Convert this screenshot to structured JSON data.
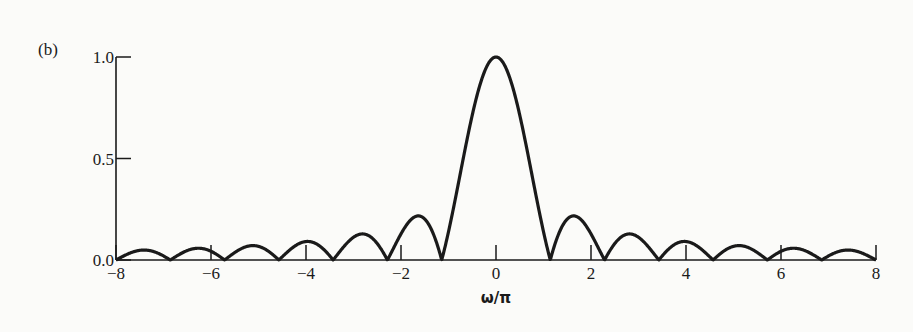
{
  "panel_label": "(b)",
  "chart_data": {
    "type": "line",
    "title": "",
    "panel": "(b)",
    "xlabel": "ω/π",
    "ylabel": "",
    "xlim": [
      -8,
      8
    ],
    "ylim": [
      0,
      1.0
    ],
    "x_ticks": [
      -8,
      -6,
      -4,
      -2,
      0,
      2,
      4,
      6,
      8
    ],
    "x_tick_labels": [
      "−8",
      "−6",
      "−4",
      "−2",
      "0",
      "2",
      "4",
      "6",
      "8"
    ],
    "y_ticks": [
      0.0,
      0.5,
      1.0
    ],
    "y_tick_labels": [
      "0.0",
      "0.5",
      "1.0"
    ],
    "grid": false,
    "legend": null,
    "series": [
      {
        "name": "magnitude",
        "function": "|sin(7πx/8)/(7πx/8)|",
        "x": [
          -8,
          -7.43,
          -6.86,
          -6.29,
          -5.71,
          -5.14,
          -4.57,
          -4.0,
          -3.43,
          -2.86,
          -2.29,
          -1.71,
          -1.14,
          -0.57,
          0,
          0.57,
          1.14,
          1.71,
          2.29,
          2.86,
          3.43,
          4.0,
          4.57,
          5.14,
          5.71,
          6.29,
          6.86,
          7.43,
          8
        ],
        "values": [
          0.0,
          0.049,
          0.0,
          0.058,
          0.0,
          0.071,
          0.0,
          0.09,
          0.0,
          0.128,
          0.0,
          0.212,
          0.0,
          0.637,
          1.0,
          0.637,
          0.0,
          0.212,
          0.0,
          0.128,
          0.0,
          0.09,
          0.0,
          0.071,
          0.0,
          0.058,
          0.0,
          0.049,
          0.0
        ]
      }
    ],
    "zeros": [
      -8,
      -6.86,
      -5.71,
      -4.57,
      -3.43,
      -2.29,
      -1.14,
      1.14,
      2.29,
      3.43,
      4.57,
      5.71,
      6.86,
      8
    ],
    "peak": {
      "x": 0,
      "y": 1.0
    },
    "first_sidelobe": 0.21
  }
}
